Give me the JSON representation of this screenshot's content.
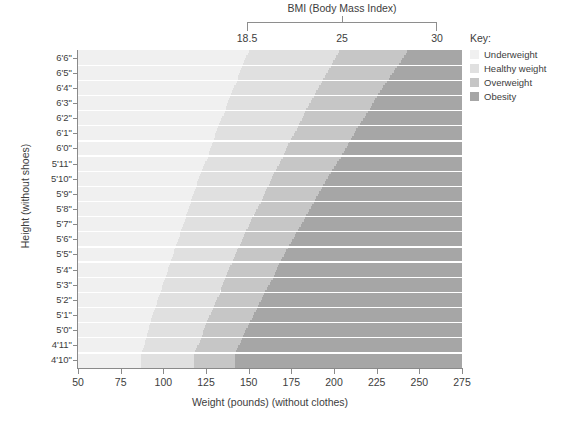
{
  "bmi_axis": {
    "title": "BMI (Body Mass Index)",
    "ticks": [
      "18.5",
      "25",
      "30"
    ]
  },
  "y_axis": {
    "title": "Height (without shoes)",
    "labels": [
      "6'6\"",
      "6'5\"",
      "6'4\"",
      "6'3\"",
      "6'2\"",
      "6'1\"",
      "6'0\"",
      "5'11\"",
      "5'10\"",
      "5'9\"",
      "5'8\"",
      "5'7\"",
      "5'6\"",
      "5'5\"",
      "5'4\"",
      "5'3\"",
      "5'2\"",
      "5'1\"",
      "5'0\"",
      "4'11\"",
      "4'10\""
    ]
  },
  "x_axis": {
    "title": "Weight (pounds) (without clothes)",
    "labels": [
      "50",
      "75",
      "100",
      "125",
      "150",
      "175",
      "200",
      "225",
      "250",
      "275"
    ]
  },
  "legend": {
    "title": "Key:",
    "items": [
      {
        "label": "Underweight",
        "color": "#f0f0f0"
      },
      {
        "label": "Healthy weight",
        "color": "#e0e0e0"
      },
      {
        "label": "Overweight",
        "color": "#c6c6c6"
      },
      {
        "label": "Obesity",
        "color": "#a6a6a6"
      }
    ]
  },
  "chart_data": {
    "type": "area",
    "title": "BMI (Body Mass Index)",
    "xlabel": "Weight (pounds) (without clothes)",
    "ylabel": "Height (without shoes)",
    "xlim": [
      50,
      275
    ],
    "ylim_labels": [
      "4'10\"",
      "6'6\""
    ],
    "grid": true,
    "legend_position": "right",
    "xticks": [
      50,
      75,
      100,
      125,
      150,
      175,
      200,
      225,
      250,
      275
    ],
    "heights_in_inches": [
      78,
      77,
      76,
      75,
      74,
      73,
      72,
      71,
      70,
      69,
      68,
      67,
      66,
      65,
      64,
      63,
      62,
      61,
      60,
      59,
      58
    ],
    "bmi_thresholds": [
      18.5,
      25,
      30
    ],
    "bands": [
      {
        "name": "Underweight",
        "bmi_range": [
          0,
          18.5
        ],
        "color": "#f0f0f0"
      },
      {
        "name": "Healthy weight",
        "bmi_range": [
          18.5,
          25
        ],
        "color": "#e0e0e0"
      },
      {
        "name": "Overweight",
        "bmi_range": [
          25,
          30
        ],
        "color": "#c6c6c6"
      },
      {
        "name": "Obesity",
        "bmi_range": [
          30,
          100
        ],
        "color": "#a6a6a6"
      }
    ],
    "boundary_weights_lbs": {
      "bmi_18_5": [
        150,
        146,
        143,
        139,
        136,
        132,
        129,
        126,
        122,
        119,
        116,
        113,
        110,
        107,
        104,
        101,
        98,
        95,
        92,
        90,
        87
      ],
      "bmi_25": [
        203,
        198,
        193,
        188,
        183,
        179,
        174,
        170,
        165,
        161,
        157,
        152,
        148,
        144,
        140,
        136,
        133,
        129,
        125,
        122,
        118
      ],
      "bmi_30": [
        243,
        237,
        231,
        225,
        220,
        214,
        209,
        204,
        198,
        193,
        188,
        183,
        178,
        173,
        168,
        164,
        159,
        155,
        150,
        146,
        142
      ]
    }
  }
}
